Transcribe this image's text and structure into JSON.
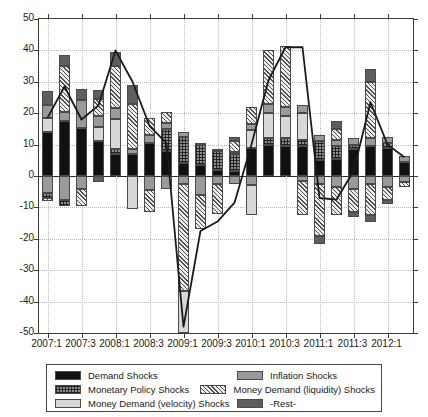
{
  "chart_data": {
    "type": "bar",
    "title": "",
    "xlabel": "",
    "ylabel": "",
    "ylim": [
      -50,
      50
    ],
    "ytick_values": [
      50,
      40,
      30,
      20,
      10,
      0,
      -10,
      -20,
      -30,
      -40,
      -50
    ],
    "ytick_labels": [
      "50",
      "40",
      "30",
      "20",
      "10",
      "0",
      "-10",
      "-20",
      "-30",
      "-40",
      "-50"
    ],
    "grid": true,
    "legend_position": "below-axes",
    "stacked": true,
    "categories": [
      "2007:1",
      "2007:2",
      "2007:3",
      "2007:4",
      "2008:1",
      "2008:2",
      "2008:3",
      "2008:4",
      "2009:1",
      "2009:2",
      "2009:3",
      "2009:4",
      "2010:1",
      "2010:2",
      "2010:3",
      "2010:4",
      "2011:1",
      "2011:2",
      "2011:3",
      "2011:4",
      "2012:1",
      "2012:2"
    ],
    "xtick_labels": [
      "2007:1",
      "2007:3",
      "2008:1",
      "2008:3",
      "2009:1",
      "2009:3",
      "2010:1",
      "2010:3",
      "2011:1",
      "2011:3",
      "2012:1"
    ],
    "xtick_categories": [
      "2007:1",
      "2007:3",
      "2008:1",
      "2008:3",
      "2009:1",
      "2009:3",
      "2010:1",
      "2010:3",
      "2011:1",
      "2011:3",
      "2012:1"
    ],
    "series": [
      {
        "name": "Demand Shocks",
        "key": "demand",
        "color": "#111111",
        "pattern": "solid-black",
        "values": [
          14.0,
          17.5,
          15.2,
          11.0,
          7.0,
          7.0,
          10.5,
          8.0,
          4.0,
          3.5,
          2.0,
          1.5,
          9.0,
          10.0,
          9.5,
          9.5,
          5.0,
          5.5,
          8.5,
          9.5,
          9.0,
          4.5
        ]
      },
      {
        "name": "Monetary Policy Shocks",
        "key": "mp",
        "color": "#8e8e8e",
        "pattern": "crosshatch",
        "values": [
          0.0,
          0.0,
          0.0,
          0.0,
          1.5,
          0.0,
          0.0,
          7.0,
          8.5,
          6.5,
          6.0,
          5.5,
          0.0,
          2.0,
          2.5,
          2.0,
          6.0,
          4.0,
          1.5,
          0.0,
          1.5,
          0.0
        ]
      },
      {
        "name": "Money Demand (velocity) Shocks",
        "key": "velocity",
        "color": "#d8d8d8",
        "pattern": "solid-light",
        "values": [
          4.5,
          0.0,
          0.0,
          4.5,
          9.5,
          0.0,
          0.0,
          0.0,
          0.0,
          0.0,
          0.0,
          0.0,
          5.5,
          8.0,
          7.0,
          8.5,
          0.0,
          0.0,
          0.0,
          0.0,
          0.0,
          0.0
        ]
      },
      {
        "name": "Inflation Shocks",
        "key": "inflation",
        "color": "#9a9a9a",
        "pattern": "solid-mid",
        "values": [
          4.0,
          3.0,
          9.0,
          3.5,
          3.5,
          1.5,
          2.5,
          2.0,
          1.5,
          0.5,
          0.5,
          0.5,
          2.0,
          3.0,
          3.0,
          2.5,
          2.0,
          2.0,
          2.0,
          2.5,
          2.0,
          2.0
        ]
      },
      {
        "name": "Money Demand (liquidity) Shocks",
        "key": "liquidity",
        "color": "#efefef",
        "pattern": "diagonal",
        "values": [
          0.0,
          14.5,
          0.0,
          5.5,
          13.5,
          14.5,
          5.5,
          3.5,
          0.0,
          0.0,
          0.0,
          3.5,
          5.5,
          17.0,
          19.5,
          0.0,
          0.0,
          3.5,
          0.0,
          18.0,
          0.0,
          0.0
        ]
      },
      {
        "name": "-Rest-",
        "key": "rest",
        "color": "#5e5e5e",
        "pattern": "solid-dark",
        "values": [
          4.5,
          3.5,
          3.5,
          3.0,
          4.5,
          6.0,
          0.0,
          0.0,
          0.0,
          0.0,
          0.0,
          1.5,
          0.0,
          0.0,
          0.0,
          0.0,
          0.0,
          2.5,
          0.0,
          4.0,
          0.0,
          0.0
        ]
      }
    ],
    "negative_series": [
      {
        "key": "inflation",
        "values": [
          -5.5,
          -7.5,
          -4.0,
          0.0,
          0.0,
          0.0,
          -4.5,
          -4.0,
          -2.5,
          -6.0,
          -2.5,
          -2.5,
          -3.0,
          0.0,
          0.0,
          -1.5,
          -2.5,
          -3.5,
          -4.0,
          -2.5,
          -3.5,
          -2.0
        ]
      },
      {
        "key": "mp",
        "values": [
          -1.5,
          -2.0,
          0.0,
          0.0,
          0.0,
          0.0,
          0.0,
          0.0,
          0.0,
          0.0,
          0.0,
          0.0,
          0.0,
          0.0,
          0.0,
          0.0,
          0.0,
          0.0,
          0.0,
          0.0,
          0.0,
          0.0
        ]
      },
      {
        "key": "liquidity",
        "values": [
          -1.0,
          0.0,
          -5.5,
          0.0,
          0.0,
          0.0,
          -7.0,
          0.0,
          -34.0,
          -11.0,
          -9.5,
          0.0,
          0.0,
          0.0,
          0.0,
          -11.0,
          -16.5,
          -9.0,
          -7.5,
          -10.0,
          -4.0,
          -1.5
        ]
      },
      {
        "key": "velocity",
        "values": [
          0.0,
          0.0,
          0.0,
          0.0,
          0.0,
          -10.5,
          0.0,
          0.0,
          -13.5,
          0.0,
          0.0,
          0.0,
          -9.5,
          0.0,
          0.0,
          0.0,
          0.0,
          0.0,
          0.0,
          0.0,
          0.0,
          0.0
        ]
      },
      {
        "key": "rest",
        "values": [
          0.0,
          0.0,
          0.0,
          -2.0,
          0.0,
          0.0,
          0.0,
          0.0,
          0.0,
          0.0,
          0.0,
          0.0,
          0.0,
          0.0,
          0.0,
          0.0,
          -2.5,
          0.0,
          -1.5,
          -2.0,
          -1.5,
          0.0
        ]
      }
    ],
    "line": {
      "name": "-Rest-",
      "color": "#1a1a1a",
      "values": [
        18.5,
        28.5,
        18.0,
        22.5,
        40.0,
        30.0,
        16.0,
        10.5,
        -48.0,
        -17.5,
        -14.5,
        -8.5,
        10.0,
        30.5,
        41.0,
        41.0,
        -7.0,
        -7.5,
        1.5,
        23.5,
        10.0,
        6.0
      ]
    }
  },
  "legend": {
    "items": [
      {
        "label": "Demand Shocks",
        "swatch": "solid-black"
      },
      {
        "label": "Inflation Shocks",
        "swatch": "solid-mid"
      },
      {
        "label": "Monetary Policy Shocks",
        "swatch": "crosshatch"
      },
      {
        "label": "Money Demand (liquidity) Shocks",
        "swatch": "diagonal"
      },
      {
        "label": "Money Demand (velocity) Shocks",
        "swatch": "solid-light"
      },
      {
        "label": "-Rest-",
        "swatch": "solid-dark"
      }
    ]
  }
}
